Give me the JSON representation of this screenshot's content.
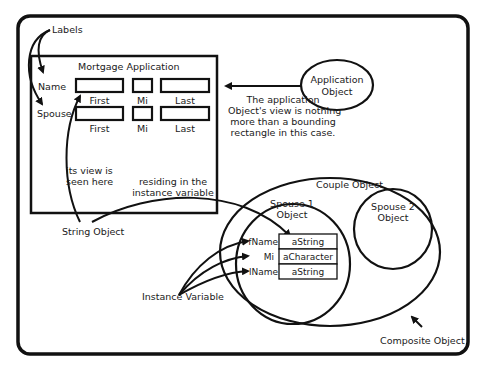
{
  "diagram": {
    "labels_callout": "Labels",
    "form": {
      "title": "Mortgage Application",
      "rows": [
        {
          "label": "Name",
          "fields": [
            "First",
            "Mi",
            "Last"
          ]
        },
        {
          "label": "Spouse",
          "fields": [
            "First",
            "Mi",
            "Last"
          ]
        }
      ]
    },
    "application_object": {
      "line1": "Application",
      "line2": "Object"
    },
    "application_note": [
      "The application",
      "Object's view is nothing",
      "more than a bounding",
      "rectangle in this case."
    ],
    "view_note": [
      "its view is",
      "seen here"
    ],
    "residing_note": [
      "residing in the",
      "instance variable"
    ],
    "string_object": "String Object",
    "couple_object": "Couple Object",
    "spouse1": {
      "line1": "Spouse 1",
      "line2": "Object"
    },
    "spouse2": {
      "line1": "Spouse 2",
      "line2": "Object"
    },
    "instance_vars": [
      {
        "name": "fName",
        "value": "aString"
      },
      {
        "name": "Mi",
        "value": "aCharacter"
      },
      {
        "name": "lName",
        "value": "aString"
      }
    ],
    "instance_variable_label": "Instance Variable",
    "composite_object": "Composite Object"
  }
}
